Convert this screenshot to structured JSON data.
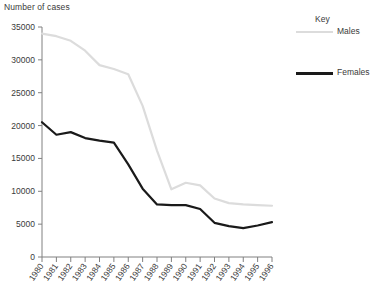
{
  "chart_data": {
    "type": "line",
    "title": "",
    "ylabel": "Number of cases",
    "xlabel": "",
    "ylim": [
      0,
      35000
    ],
    "y_ticks": [
      0,
      5000,
      10000,
      15000,
      20000,
      25000,
      30000,
      35000
    ],
    "y_tick_labels": [
      "0",
      "5000",
      "10000",
      "15000",
      "20000",
      "25000",
      "30000",
      "35000"
    ],
    "grid": false,
    "legend_position": "right",
    "legend_title": "Key",
    "categories": [
      1980,
      1981,
      1982,
      1983,
      1984,
      1985,
      1986,
      1987,
      1988,
      1989,
      1990,
      1991,
      1992,
      1993,
      1994,
      1995,
      1996
    ],
    "x_tick_labels": [
      "1980",
      "1981",
      "1982",
      "1983",
      "1984",
      "1985",
      "1986",
      "1987",
      "1988",
      "1989",
      "1990",
      "1991",
      "1992",
      "1993",
      "1994",
      "1995",
      "1996"
    ],
    "series": [
      {
        "name": "Males",
        "color": "#dcdcdc",
        "line_width": 2.2,
        "values": [
          34000,
          33600,
          32900,
          31400,
          29200,
          28600,
          27800,
          23000,
          16200,
          10300,
          11300,
          10900,
          8900,
          8200,
          8000,
          7900,
          7800
        ]
      },
      {
        "name": "Females",
        "color": "#1a1a1a",
        "line_width": 2.2,
        "values": [
          20500,
          18600,
          19000,
          18100,
          17700,
          17400,
          14100,
          10400,
          8000,
          7900,
          7900,
          7300,
          5200,
          4700,
          4400,
          4800,
          5300
        ]
      }
    ]
  },
  "legend": {
    "title": "Key",
    "items": [
      {
        "label": "Males",
        "color": "#dcdcdc"
      },
      {
        "label": "Females",
        "color": "#1a1a1a"
      }
    ]
  }
}
